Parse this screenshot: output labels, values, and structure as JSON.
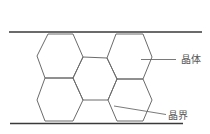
{
  "diagram": {
    "type": "grain-structure",
    "labels": {
      "crystal": "晶体",
      "grain_boundary": "晶界"
    },
    "colors": {
      "line": "#6b6b6b",
      "border_line": "#3a3a3a",
      "background": "#ffffff",
      "text": "#555555"
    },
    "elements": {
      "boundary_lines": [
        "top",
        "bottom"
      ],
      "hexagon_grains": [
        {
          "position": "left-top"
        },
        {
          "position": "left-bottom"
        },
        {
          "position": "right-top"
        },
        {
          "position": "right-bottom"
        },
        {
          "position": "center"
        }
      ],
      "callouts": [
        {
          "label": "晶体",
          "target": "right-top grain interior"
        },
        {
          "label": "晶界",
          "target": "grain boundary between center and right-bottom grain"
        }
      ]
    }
  }
}
